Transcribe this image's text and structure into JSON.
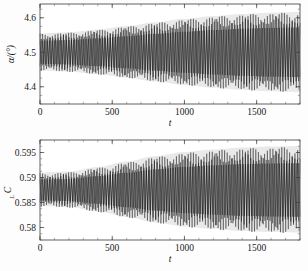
{
  "figure": {
    "background": "#fdfdfd",
    "trace_color": "#0d0d0d",
    "axis_color": "#3a3a3a",
    "panel_count": 2
  },
  "chart_data": [
    {
      "id": "alpha-vs-t",
      "type": "line",
      "title": "",
      "xlabel": "t",
      "ylabel": "α/(°)",
      "ylabel_main": "α/(°)",
      "xlim": [
        0,
        1800
      ],
      "ylim": [
        4.35,
        4.64
      ],
      "grid": false,
      "legend": "none",
      "xticks": [
        0,
        500,
        1000,
        1500
      ],
      "xticklabels": [
        "0",
        "500",
        "1000",
        "1500"
      ],
      "yticks": [
        4.4,
        4.5,
        4.6
      ],
      "yticklabels": [
        "4.4",
        "4.5",
        "4.6"
      ],
      "x_minor_step": 100,
      "y_minor_step": 0.025,
      "series": [
        {
          "name": "angle of attack oscillation",
          "description": "densely oscillating signal with slowly growing amplitude envelope (limit-cycle flutter build-up)",
          "center": 4.5,
          "carrier_period": 18.0,
          "modulation_period": 210.0,
          "modulation_depth": 0.28,
          "envelope_start": 0.055,
          "envelope_end": 0.115,
          "envelope_growth": "saturating-exponential"
        }
      ],
      "envelope_upper": {
        "x": [
          0,
          200,
          400,
          600,
          800,
          1000,
          1200,
          1400,
          1600,
          1800
        ],
        "y": [
          4.555,
          4.558,
          4.566,
          4.576,
          4.587,
          4.597,
          4.605,
          4.611,
          4.615,
          4.617
        ]
      },
      "envelope_lower": {
        "x": [
          0,
          200,
          400,
          600,
          800,
          1000,
          1200,
          1400,
          1600,
          1800
        ],
        "y": [
          4.447,
          4.444,
          4.436,
          4.426,
          4.415,
          4.405,
          4.397,
          4.391,
          4.387,
          4.385
        ]
      }
    },
    {
      "id": "cl-vs-t",
      "type": "line",
      "title": "",
      "xlabel": "t",
      "ylabel": "C_L",
      "ylabel_main": "C",
      "ylabel_subscript": "L",
      "xlim": [
        0,
        1800
      ],
      "ylim": [
        0.5775,
        0.5975
      ],
      "grid": false,
      "legend": "none",
      "xticks": [
        0,
        500,
        1000,
        1500
      ],
      "xticklabels": [
        "0",
        "500",
        "1000",
        "1500"
      ],
      "yticks": [
        0.58,
        0.585,
        0.59,
        0.595
      ],
      "yticklabels": [
        "0.58",
        "0.585",
        "0.59",
        "0.595"
      ],
      "x_minor_step": 100,
      "y_minor_step": 0.00125,
      "series": [
        {
          "name": "lift coefficient oscillation",
          "description": "densely oscillating signal with slowly growing amplitude envelope",
          "center": 0.5875,
          "carrier_period": 18.0,
          "modulation_period": 210.0,
          "modulation_depth": 0.3,
          "envelope_start": 0.0035,
          "envelope_end": 0.0083,
          "envelope_growth": "saturating-exponential"
        }
      ],
      "envelope_upper": {
        "x": [
          0,
          200,
          400,
          600,
          800,
          1000,
          1200,
          1400,
          1600,
          1800
        ],
        "y": [
          0.591,
          0.5912,
          0.5921,
          0.5932,
          0.5943,
          0.5951,
          0.5956,
          0.596,
          0.5962,
          0.5963
        ]
      },
      "envelope_lower": {
        "x": [
          0,
          200,
          400,
          600,
          800,
          1000,
          1200,
          1400,
          1600,
          1800
        ],
        "y": [
          0.5843,
          0.5841,
          0.5832,
          0.5821,
          0.581,
          0.5802,
          0.5797,
          0.5793,
          0.5791,
          0.579
        ]
      }
    }
  ]
}
